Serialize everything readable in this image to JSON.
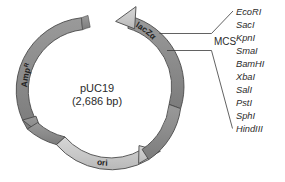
{
  "figure": {
    "plasmid_name": "pUC19",
    "plasmid_size": "(2,686 bp)"
  },
  "features": [
    {
      "id": "ampR",
      "label": "Amp",
      "superscript": "R",
      "color": "#8e8e8e",
      "direction": "counterclockwise"
    },
    {
      "id": "lacZalpha",
      "label": "lacZα",
      "color": "#8e8e8e",
      "direction": "counterclockwise"
    },
    {
      "id": "ori",
      "label": "ori",
      "color": "#c9c9c9",
      "direction": "clockwise"
    }
  ],
  "mcs": {
    "label": "MCS",
    "enzymes": [
      "EcoRI",
      "SacI",
      "KpnI",
      "SmaI",
      "BamHI",
      "XbaI",
      "SalI",
      "PstI",
      "SphI",
      "HindIII"
    ]
  },
  "colors": {
    "backbone_dark": "#8e8e8e",
    "backbone_light": "#c9c9c9",
    "outline": "#4a4a4a",
    "text": "#2b2b2b",
    "background": "#ffffff"
  }
}
